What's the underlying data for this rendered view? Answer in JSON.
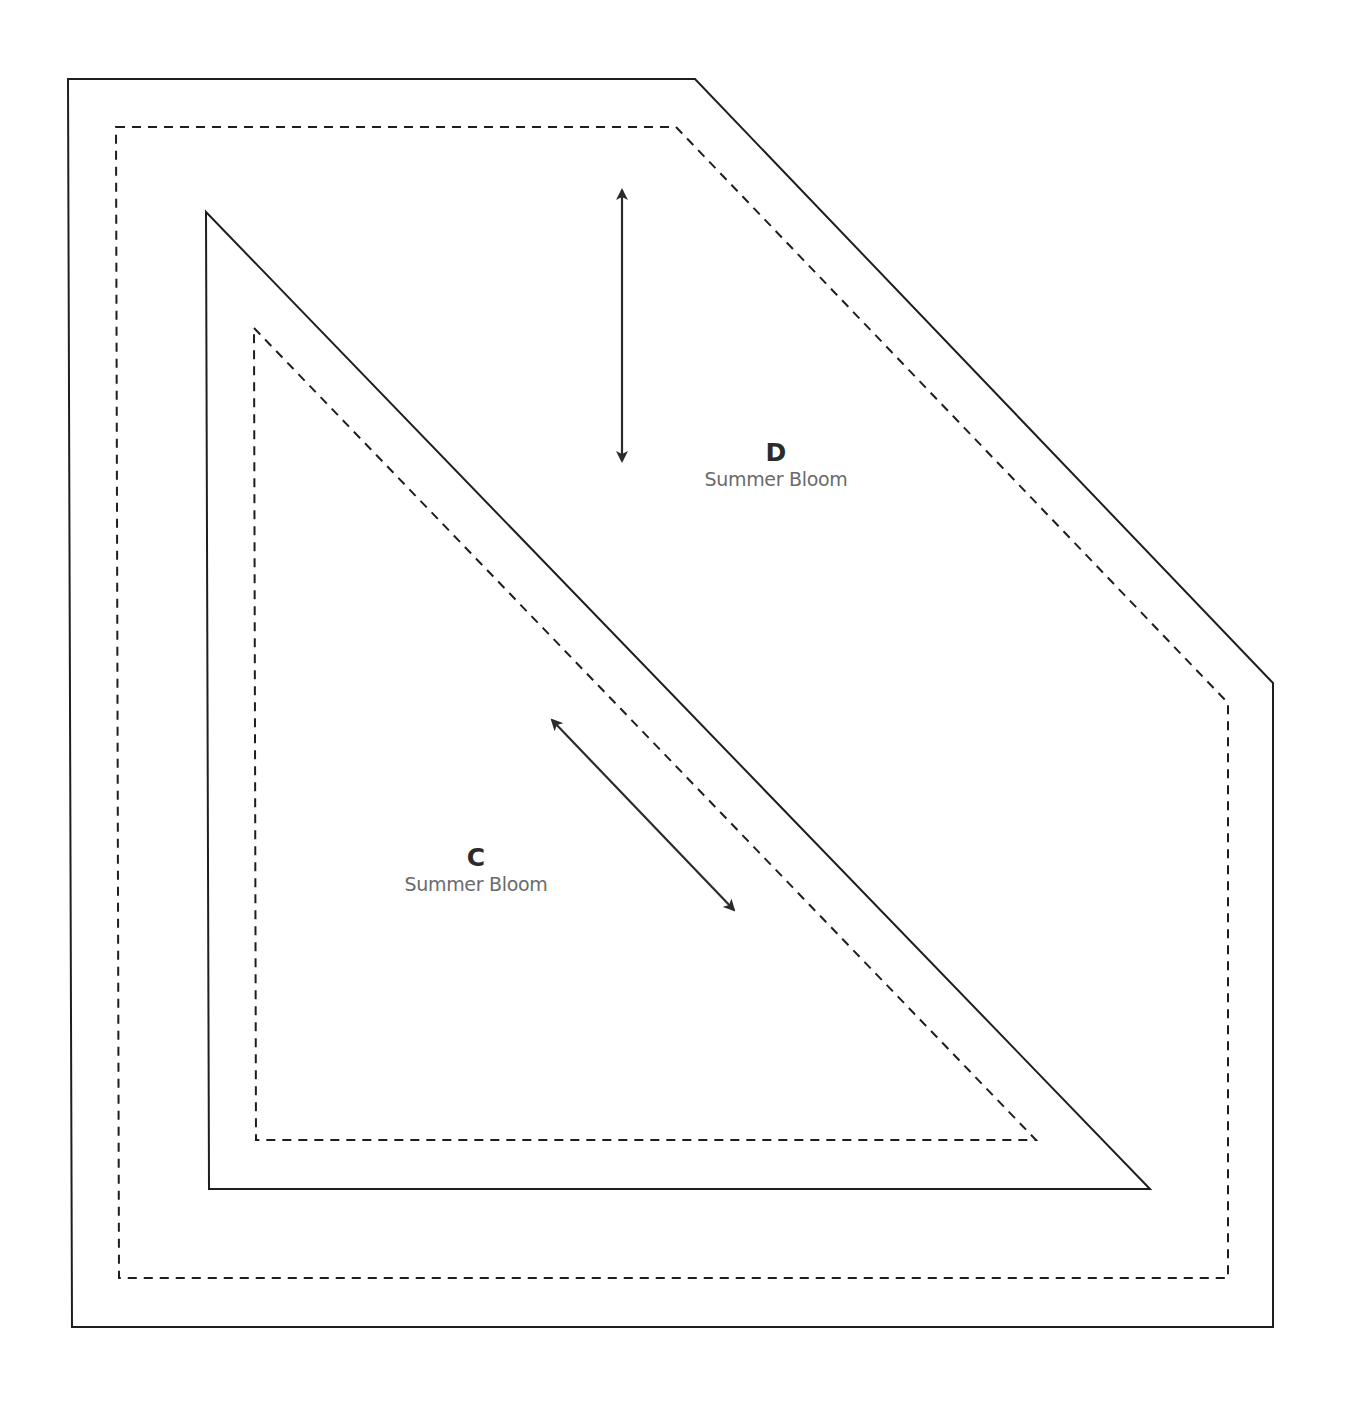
{
  "colors": {
    "line": "#1e1e1e",
    "letter": "#2b2b2b",
    "fabric_text": "#6b6b6b",
    "background": "#ffffff"
  },
  "pieces": [
    {
      "id": "D",
      "letter": "D",
      "fabric": "Summer Bloom",
      "cut_line": "68,79 695,79 1273,683 1273,1327 72,1327",
      "seam_line": "116,127 676,127 1228,703 1228,1278 119,1278",
      "grain_arrow": {
        "x1": 622,
        "y1": 190,
        "x2": 622,
        "y2": 461
      },
      "label_pos": {
        "x": 776,
        "y": 438
      }
    },
    {
      "id": "C",
      "letter": "C",
      "fabric": "Summer Bloom",
      "cut_line": "206,212 1150,1189 209,1189",
      "seam_line": "254,328 1036,1140 256,1140",
      "grain_arrow": {
        "x1": 552,
        "y1": 720,
        "x2": 734,
        "y2": 910
      },
      "label_pos": {
        "x": 476,
        "y": 843
      }
    }
  ]
}
